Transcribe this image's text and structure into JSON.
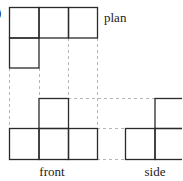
{
  "figure": {
    "marker": ")",
    "labels": {
      "plan": "plan",
      "front": "front",
      "side": "side"
    },
    "colors": {
      "line": "#2a2a2a",
      "dash": "#b0b0b0",
      "background": "#ffffff"
    }
  }
}
